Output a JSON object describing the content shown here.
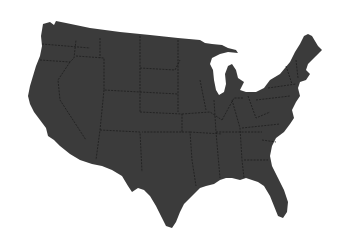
{
  "map": {
    "subject": "Contiguous United States silhouette",
    "style": "solid fill with faint state boundaries",
    "colors": {
      "background": "#ffffff",
      "land": "#3b3b3b",
      "state_borders": "#1c1c1c"
    }
  }
}
